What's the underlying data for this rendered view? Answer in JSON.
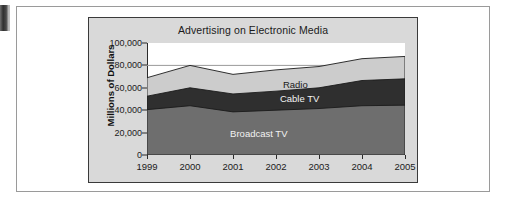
{
  "figure": {
    "edge_mark": "page-edge-artifact"
  },
  "chart_data": {
    "type": "area",
    "stacked": true,
    "title": "Advertising on Electronic Media",
    "xlabel": "",
    "ylabel": "Millions of Dollars",
    "categories": [
      "1999",
      "2000",
      "2001",
      "2002",
      "2003",
      "2004",
      "2005"
    ],
    "x": [
      1999,
      2000,
      2001,
      2002,
      2003,
      2004,
      2005
    ],
    "ylim": [
      0,
      100000
    ],
    "yticks": [
      0,
      20000,
      40000,
      60000,
      80000,
      100000
    ],
    "ytick_labels": [
      "0",
      "20,000",
      "40,000",
      "60,000",
      "80,000",
      "100,000"
    ],
    "grid": false,
    "legend": "in-plot-labels",
    "series": [
      {
        "name": "Broadcast TV",
        "color": "#6e6e6e",
        "values": [
          40500,
          44000,
          38500,
          40000,
          41500,
          44000,
          44500
        ],
        "label_x": 2001.6,
        "label_y": 20000
      },
      {
        "name": "Cable TV",
        "color": "#2f2f2f",
        "values": [
          12000,
          16000,
          16000,
          17000,
          18500,
          22500,
          23500
        ],
        "cumulative_top": [
          52500,
          60000,
          54500,
          57000,
          60000,
          66500,
          68000
        ],
        "label_x": 2002.55,
        "label_y": 50500
      },
      {
        "name": "Radio",
        "color": "#cccccc",
        "values": [
          16500,
          20000,
          17500,
          19000,
          19000,
          19500,
          20000
        ],
        "cumulative_top": [
          69000,
          80000,
          72000,
          76000,
          79000,
          86000,
          88000
        ],
        "label_x": 2002.45,
        "label_y": 63500
      }
    ]
  }
}
